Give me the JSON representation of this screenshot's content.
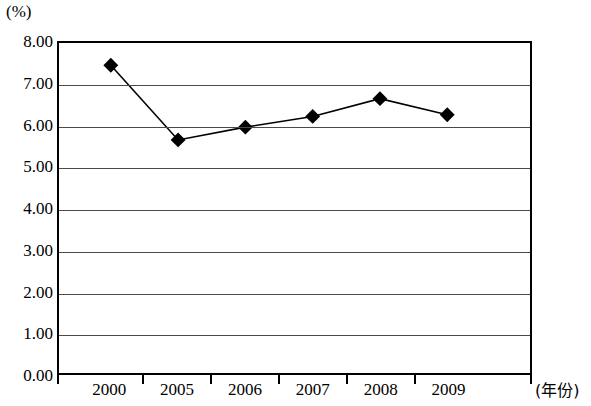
{
  "chart_data": {
    "type": "line",
    "title": "",
    "subtitle": "",
    "xlabel": "(年份)",
    "ylabel": "(%)",
    "categories": [
      "2000",
      "2005",
      "2006",
      "2007",
      "2008",
      "2009"
    ],
    "values": [
      7.46,
      5.65,
      5.96,
      6.22,
      6.65,
      6.26
    ],
    "series": [
      {
        "name": "",
        "values": [
          7.46,
          5.65,
          5.96,
          6.22,
          6.65,
          6.26
        ]
      }
    ],
    "ylim": [
      0.0,
      8.0
    ],
    "ytick_step": 1.0,
    "ytick_labels": [
      "8.00",
      "7.00",
      "6.00",
      "5.00",
      "4.00",
      "3.00",
      "2.00",
      "1.00",
      "0.00"
    ],
    "ytick_values": [
      8,
      7,
      6,
      5,
      4,
      3,
      2,
      1,
      0
    ],
    "xtick_labels": [
      "2000",
      "2005",
      "2006",
      "2007",
      "2008",
      "2009"
    ],
    "grid": true,
    "grid_orientation": "horizontal",
    "legend": false,
    "legend_position": "none",
    "marker": "diamond",
    "line_color": "#000000",
    "marker_color": "#000000",
    "grid_color": "#4a4a4a",
    "background_color": "#ffffff",
    "annotations": []
  },
  "axes": {
    "unit_label": "(%)",
    "x_title": "(年份)"
  }
}
